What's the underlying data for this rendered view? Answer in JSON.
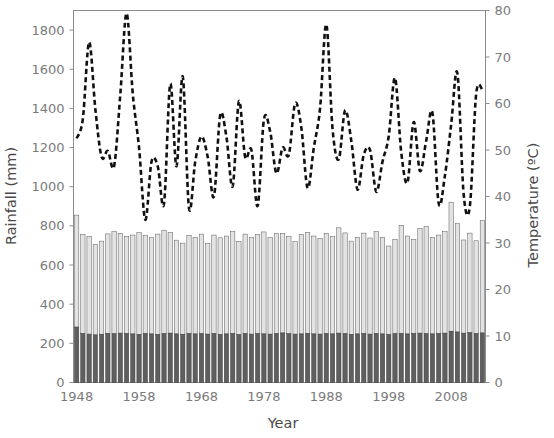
{
  "chart_data": {
    "type": "bar",
    "title": "",
    "subtitle": "",
    "xlabel": "Year",
    "ylabel": "Rainfall (mm)",
    "y2label": "Temperature (ºC)",
    "xlim": [
      1947.5,
      2013.5
    ],
    "ylim": [
      0,
      1900
    ],
    "y2lim": [
      0,
      80
    ],
    "grid": false,
    "legend": "none",
    "x_tick_labels": [
      "1948",
      "1958",
      "1968",
      "1978",
      "1988",
      "1998",
      "2008"
    ],
    "x_tick_values": [
      1948,
      1958,
      1968,
      1978,
      1988,
      1998,
      2008
    ],
    "y_tick_labels": [
      "0",
      "200",
      "400",
      "600",
      "800",
      "1000",
      "1200",
      "1400",
      "1600",
      "1800"
    ],
    "y_tick_values": [
      0,
      200,
      400,
      600,
      800,
      1000,
      1200,
      1400,
      1600,
      1800
    ],
    "y2_tick_labels": [
      "0",
      "10",
      "20",
      "30",
      "40",
      "50",
      "60",
      "70",
      "80"
    ],
    "y2_tick_values": [
      0,
      10,
      20,
      30,
      40,
      50,
      60,
      70,
      80
    ],
    "x": [
      1948,
      1949,
      1950,
      1951,
      1952,
      1953,
      1954,
      1955,
      1956,
      1957,
      1958,
      1959,
      1960,
      1961,
      1962,
      1963,
      1964,
      1965,
      1966,
      1967,
      1968,
      1969,
      1970,
      1971,
      1972,
      1973,
      1974,
      1975,
      1976,
      1977,
      1978,
      1979,
      1980,
      1981,
      1982,
      1983,
      1984,
      1985,
      1986,
      1987,
      1988,
      1989,
      1990,
      1991,
      1992,
      1993,
      1994,
      1995,
      1996,
      1997,
      1998,
      1999,
      2000,
      2001,
      2002,
      2003,
      2004,
      2005,
      2006,
      2007,
      2008,
      2009,
      2010,
      2011,
      2012,
      2013
    ],
    "series": [
      {
        "name": "Rainfall lower (stacked, mm)",
        "axis": "left",
        "type": "bar-segment",
        "color": "#5f5f5f",
        "values": [
          283,
          250,
          247,
          243,
          246,
          250,
          249,
          252,
          250,
          248,
          246,
          250,
          248,
          246,
          250,
          252,
          248,
          246,
          250,
          248,
          250,
          247,
          250,
          246,
          248,
          250,
          244,
          250,
          247,
          250,
          248,
          247,
          250,
          253,
          249,
          247,
          248,
          250,
          248,
          247,
          250,
          248,
          252,
          249,
          246,
          248,
          250,
          247,
          250,
          248,
          245,
          249,
          251,
          248,
          250,
          252,
          249,
          248,
          250,
          252,
          262,
          258,
          252,
          254,
          250,
          253
        ]
      },
      {
        "name": "Rainfall upper (stacked, mm)",
        "axis": "left",
        "type": "bar-segment",
        "color": "#e3e3e3",
        "values": [
          572,
          505,
          500,
          463,
          476,
          509,
          521,
          509,
          497,
          505,
          519,
          500,
          492,
          512,
          528,
          515,
          479,
          466,
          502,
          493,
          508,
          462,
          503,
          493,
          500,
          520,
          476,
          508,
          495,
          506,
          521,
          494,
          510,
          509,
          497,
          473,
          509,
          515,
          500,
          489,
          512,
          497,
          538,
          515,
          476,
          493,
          513,
          491,
          521,
          494,
          452,
          482,
          552,
          500,
          481,
          535,
          548,
          493,
          503,
          519,
          659,
          553,
          476,
          509,
          474,
          574
        ]
      },
      {
        "name": "Temperature (ºC)",
        "axis": "right",
        "type": "line",
        "style": "dashed",
        "color": "#111111",
        "values": [
          52.5,
          56.7,
          73.2,
          58.8,
          48.5,
          49.8,
          46.5,
          62.0,
          79.4,
          62.0,
          50.5,
          35.0,
          47.5,
          46.5,
          38.5,
          64.2,
          46.5,
          65.8,
          37.5,
          47.5,
          52.9,
          48.5,
          40.0,
          57.5,
          52.8,
          42.2,
          60.5,
          48.5,
          50.0,
          38.0,
          56.5,
          54.0,
          45.0,
          50.5,
          49.0,
          60.0,
          54.8,
          41.8,
          50.5,
          59.0,
          77.0,
          54.5,
          48.0,
          58.5,
          52.0,
          41.5,
          49.0,
          50.0,
          41.0,
          47.5,
          53.0,
          65.5,
          49.5,
          43.0,
          56.0,
          45.5,
          52.0,
          58.0,
          38.5,
          44.5,
          55.5,
          66.5,
          40.5,
          38.0,
          62.0,
          63.0
        ]
      }
    ]
  }
}
